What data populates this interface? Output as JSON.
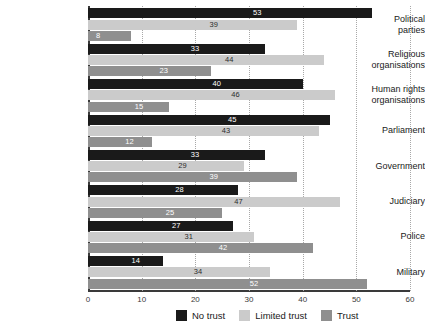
{
  "chart_data": {
    "type": "bar",
    "orientation": "horizontal",
    "title": "",
    "subtitle": "",
    "xlabel": "",
    "ylabel": "",
    "xlim": [
      0,
      60
    ],
    "xticks": [
      0,
      10,
      20,
      30,
      40,
      50,
      60
    ],
    "xtick_labels": [
      "0",
      "10",
      "20",
      "30",
      "40",
      "50",
      "60"
    ],
    "grid": "vertical-dotted",
    "legend_position": "bottom",
    "categories": [
      "Political parties",
      "Religious organisations",
      "Human rights organisations",
      "Parliament",
      "Government",
      "Judiciary",
      "Police",
      "Military"
    ],
    "category_lines": [
      [
        "Political",
        "parties"
      ],
      [
        "Religious",
        "organisations"
      ],
      [
        "Human rights",
        "organisations"
      ],
      [
        "Parliament"
      ],
      [
        "Government"
      ],
      [
        "Judiciary"
      ],
      [
        "Police"
      ],
      [
        "Military"
      ]
    ],
    "series": [
      {
        "name": "No trust",
        "color": "#1a1a1a",
        "values": [
          53,
          33,
          40,
          45,
          33,
          28,
          27,
          14
        ]
      },
      {
        "name": "Limited trust",
        "color": "#cbcbcb",
        "values": [
          39,
          44,
          46,
          43,
          29,
          47,
          31,
          34
        ]
      },
      {
        "name": "Trust",
        "color": "#8f8f8f",
        "values": [
          8,
          23,
          15,
          12,
          39,
          25,
          42,
          52
        ]
      }
    ]
  },
  "legend": {
    "items": [
      {
        "label": "No trust",
        "color": "#1a1a1a"
      },
      {
        "label": "Limited trust",
        "color": "#cbcbcb"
      },
      {
        "label": "Trust",
        "color": "#8f8f8f"
      }
    ]
  }
}
